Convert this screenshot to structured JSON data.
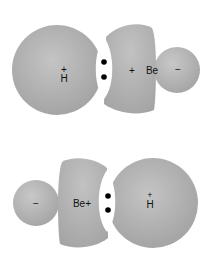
{
  "diagrams": [
    {
      "id": "top",
      "description": "H–Be bond with H on left, Be on right",
      "labels": {
        "h_charge": "+",
        "h_atom": "H",
        "be_charge": "+",
        "be_atom": "Be",
        "end_charge": "−"
      },
      "electron_pair_dots": 2
    },
    {
      "id": "bottom",
      "description": "Be–H bond with Be on left, H on right",
      "labels": {
        "end_charge": "−",
        "be_atom": "Be+",
        "h_charge": "+",
        "h_atom": "H"
      },
      "electron_pair_dots": 2
    }
  ],
  "colors": {
    "orbital_fill": "#a9a9a9",
    "orbital_highlight": "#c8c8c8",
    "lens": "#ffffff",
    "dot": "#000000",
    "text": "#111111"
  }
}
